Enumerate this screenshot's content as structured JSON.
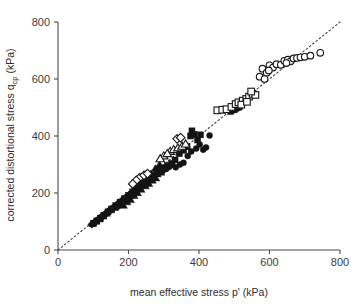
{
  "chart_data": {
    "type": "scatter",
    "title": "",
    "xlabel": "mean effective stress p' (kPa)",
    "ylabel_main": "corrected distortional stress q",
    "ylabel_sub": "cp",
    "ylabel_unit": " (kPa)",
    "ylabel_full": "corrected distortional stress q_cp (kPa)",
    "xlim": [
      0,
      800
    ],
    "ylim": [
      0,
      800
    ],
    "xticks": [
      0,
      200,
      400,
      600,
      800
    ],
    "yticks": [
      0,
      200,
      400,
      600,
      800
    ],
    "xtick_labels": [
      "0",
      "200",
      "400",
      "600",
      "800"
    ],
    "ytick_labels": [
      "0",
      "200",
      "400",
      "600",
      "800"
    ],
    "grid": false,
    "legend": "none",
    "annotations": [
      {
        "name": "identity-reference-line",
        "kind": "dotted-line",
        "from": [
          0,
          0
        ],
        "to": [
          800,
          800
        ],
        "description": "1:1 dotted reference line from origin to upper right"
      }
    ],
    "marker_colors": {
      "filled": "#141414",
      "open_face": "#ffffff",
      "open_edge": "#1b1b1b",
      "axis": "#4a4a4a",
      "reference_line": "#3a3a3a"
    },
    "series": [
      {
        "name": "filled-circles",
        "marker": "circle",
        "filled": true,
        "points": [
          [
            103,
            96
          ],
          [
            112,
            104
          ],
          [
            124,
            116
          ],
          [
            133,
            124
          ],
          [
            146,
            138
          ],
          [
            158,
            150
          ],
          [
            170,
            162
          ],
          [
            182,
            172
          ],
          [
            196,
            186
          ],
          [
            205,
            196
          ],
          [
            216,
            208
          ],
          [
            228,
            218
          ],
          [
            238,
            228
          ],
          [
            248,
            236
          ],
          [
            258,
            244
          ],
          [
            272,
            258
          ],
          [
            284,
            268
          ],
          [
            296,
            276
          ],
          [
            308,
            286
          ],
          [
            316,
            292
          ],
          [
            324,
            300
          ],
          [
            334,
            290
          ],
          [
            346,
            300
          ],
          [
            356,
            306
          ],
          [
            368,
            330
          ],
          [
            378,
            346
          ],
          [
            392,
            356
          ],
          [
            402,
            370
          ],
          [
            412,
            352
          ],
          [
            420,
            360
          ],
          [
            430,
            402
          ],
          [
            306,
            284
          ],
          [
            262,
            252
          ],
          [
            240,
            230
          ],
          [
            498,
            490
          ],
          [
            508,
            496
          ],
          [
            516,
            500
          ]
        ]
      },
      {
        "name": "filled-squares",
        "marker": "square",
        "filled": true,
        "points": [
          [
            100,
            94
          ],
          [
            110,
            102
          ],
          [
            120,
            112
          ],
          [
            130,
            122
          ],
          [
            142,
            134
          ],
          [
            152,
            144
          ],
          [
            164,
            156
          ],
          [
            176,
            168
          ],
          [
            188,
            180
          ],
          [
            200,
            192
          ],
          [
            212,
            204
          ],
          [
            224,
            216
          ],
          [
            236,
            226
          ],
          [
            246,
            240
          ],
          [
            256,
            250
          ],
          [
            268,
            262
          ],
          [
            280,
            272
          ],
          [
            290,
            280
          ],
          [
            300,
            288
          ],
          [
            310,
            296
          ],
          [
            322,
            304
          ],
          [
            332,
            316
          ],
          [
            344,
            338
          ],
          [
            356,
            350
          ],
          [
            366,
            362
          ],
          [
            376,
            400
          ],
          [
            380,
            418
          ],
          [
            386,
            406
          ],
          [
            396,
            386
          ],
          [
            404,
            404
          ],
          [
            242,
            236
          ],
          [
            252,
            248
          ],
          [
            286,
            284
          ],
          [
            294,
            286
          ],
          [
            490,
            486
          ],
          [
            500,
            492
          ]
        ]
      },
      {
        "name": "filled-triangles",
        "marker": "triangle",
        "filled": true,
        "points": [
          [
            98,
            92
          ],
          [
            108,
            100
          ],
          [
            118,
            108
          ],
          [
            128,
            118
          ],
          [
            138,
            128
          ],
          [
            150,
            140
          ],
          [
            160,
            148
          ],
          [
            172,
            160
          ],
          [
            184,
            170
          ],
          [
            192,
            178
          ],
          [
            204,
            190
          ],
          [
            214,
            200
          ],
          [
            222,
            210
          ],
          [
            232,
            218
          ],
          [
            242,
            226
          ],
          [
            252,
            238
          ],
          [
            262,
            246
          ],
          [
            272,
            256
          ],
          [
            282,
            266
          ],
          [
            292,
            272
          ],
          [
            186,
            156
          ],
          [
            196,
            168
          ],
          [
            206,
            176
          ],
          [
            216,
            190
          ],
          [
            226,
            200
          ],
          [
            236,
            212
          ],
          [
            248,
            224
          ],
          [
            258,
            232
          ],
          [
            268,
            244
          ],
          [
            278,
            252
          ],
          [
            288,
            300
          ],
          [
            276,
            286
          ],
          [
            264,
            268
          ]
        ]
      },
      {
        "name": "filled-diamonds",
        "marker": "diamond",
        "filled": true,
        "points": [
          [
            96,
            90
          ],
          [
            106,
            98
          ],
          [
            116,
            110
          ],
          [
            126,
            120
          ],
          [
            136,
            130
          ],
          [
            148,
            142
          ],
          [
            156,
            146
          ],
          [
            168,
            158
          ],
          [
            178,
            170
          ],
          [
            190,
            182
          ],
          [
            202,
            194
          ],
          [
            210,
            198
          ],
          [
            220,
            212
          ],
          [
            230,
            222
          ],
          [
            244,
            234
          ],
          [
            254,
            246
          ],
          [
            266,
            256
          ],
          [
            278,
            268
          ],
          [
            170,
            152
          ],
          [
            180,
            166
          ]
        ]
      },
      {
        "name": "open-circles",
        "marker": "circle",
        "filled": false,
        "points": [
          [
            572,
            608
          ],
          [
            580,
            636
          ],
          [
            592,
            622
          ],
          [
            600,
            648
          ],
          [
            610,
            640
          ],
          [
            620,
            652
          ],
          [
            632,
            650
          ],
          [
            642,
            664
          ],
          [
            652,
            668
          ],
          [
            660,
            662
          ],
          [
            668,
            672
          ],
          [
            678,
            674
          ],
          [
            688,
            676
          ],
          [
            700,
            678
          ],
          [
            716,
            682
          ],
          [
            744,
            692
          ],
          [
            586,
            600
          ],
          [
            598,
            630
          ],
          [
            648,
            656
          ]
        ]
      },
      {
        "name": "open-squares",
        "marker": "square",
        "filled": false,
        "points": [
          [
            452,
            490
          ],
          [
            466,
            492
          ],
          [
            478,
            494
          ],
          [
            492,
            502
          ],
          [
            504,
            512
          ],
          [
            512,
            518
          ],
          [
            524,
            524
          ],
          [
            534,
            530
          ],
          [
            542,
            538
          ],
          [
            552,
            548
          ],
          [
            560,
            544
          ],
          [
            548,
            556
          ],
          [
            520,
            510
          ],
          [
            536,
            520
          ]
        ]
      },
      {
        "name": "open-triangles",
        "marker": "triangle",
        "filled": false,
        "points": [
          [
            318,
            346
          ],
          [
            328,
            352
          ],
          [
            340,
            358
          ],
          [
            300,
            330
          ],
          [
            310,
            338
          ],
          [
            290,
            320
          ],
          [
            352,
            364
          ],
          [
            362,
            372
          ]
        ]
      },
      {
        "name": "open-diamonds",
        "marker": "diamond",
        "filled": false,
        "points": [
          [
            232,
            254
          ],
          [
            222,
            244
          ],
          [
            244,
            262
          ],
          [
            254,
            268
          ],
          [
            212,
            232
          ],
          [
            338,
            390
          ],
          [
            348,
            394
          ]
        ]
      }
    ]
  }
}
